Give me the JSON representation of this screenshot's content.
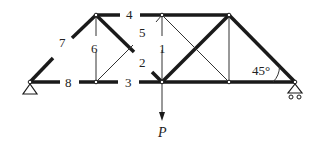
{
  "diagram": {
    "type": "truss",
    "nodes": {
      "A": [
        30,
        82
      ],
      "B": [
        96,
        82
      ],
      "C": [
        162,
        82
      ],
      "D": [
        229,
        82
      ],
      "E": [
        295,
        82
      ],
      "F": [
        96,
        15
      ],
      "G": [
        162,
        15
      ],
      "H": [
        229,
        15
      ]
    },
    "member_labels": [
      {
        "id": "m1",
        "text": "1",
        "x": 159,
        "y": 41
      },
      {
        "id": "m2",
        "text": "2",
        "x": 139,
        "y": 56
      },
      {
        "id": "m3",
        "text": "3",
        "x": 125,
        "y": 77
      },
      {
        "id": "m4",
        "text": "4",
        "x": 125,
        "y": 10
      },
      {
        "id": "m5",
        "text": "5",
        "x": 139,
        "y": 27
      },
      {
        "id": "m6",
        "text": "6",
        "x": 91,
        "y": 43
      },
      {
        "id": "m7",
        "text": "7",
        "x": 60,
        "y": 43
      },
      {
        "id": "m8",
        "text": "8",
        "x": 65,
        "y": 77
      }
    ],
    "load_label": "P",
    "angle_label": "45°",
    "colors": {
      "line": "#1a1a1a",
      "thin_line": "#333333",
      "background": "#ffffff"
    }
  }
}
